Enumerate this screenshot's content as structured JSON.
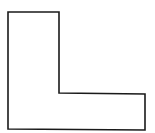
{
  "diagram": {
    "shape": "L-shape",
    "stroke_color": "#1a1a1a",
    "fill_color": "#ffffff",
    "points": "8,12 59,12 59,93 145,94 145,130 8,129"
  }
}
